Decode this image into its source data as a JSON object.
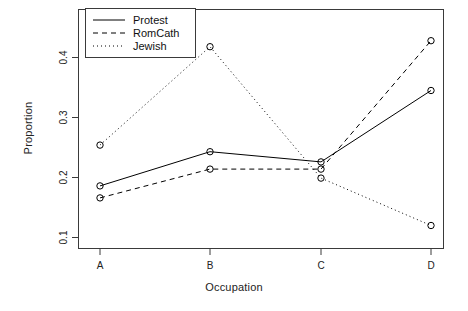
{
  "chart_data": {
    "type": "line",
    "title": "",
    "xlabel": "Occupation",
    "ylabel": "Proportion",
    "categories": [
      "A",
      "B",
      "C",
      "D"
    ],
    "xtick_labels": [
      "A",
      "B",
      "C",
      "D"
    ],
    "ytick_labels": [
      "0.1",
      "0.2",
      "0.3",
      "0.4"
    ],
    "ytick_values": [
      0.1,
      0.2,
      0.3,
      0.4
    ],
    "ylim": [
      0.085,
      0.435
    ],
    "xlim": [
      0.6,
      4.4
    ],
    "grid": false,
    "markers": "open-circle",
    "legend_position": "top-left",
    "series": [
      {
        "name": "Protest",
        "linestyle": "solid",
        "color": "#000000",
        "values": [
          0.186,
          0.243,
          0.226,
          0.345
        ]
      },
      {
        "name": "RomCath",
        "linestyle": "dashed",
        "color": "#000000",
        "values": [
          0.166,
          0.214,
          0.214,
          0.428
        ]
      },
      {
        "name": "Jewish",
        "linestyle": "dotted",
        "color": "#000000",
        "values": [
          0.254,
          0.418,
          0.199,
          0.12
        ]
      }
    ]
  },
  "legend": {
    "entries": [
      {
        "label": "Protest",
        "style": "solid"
      },
      {
        "label": "RomCath",
        "style": "dashed"
      },
      {
        "label": "Jewish",
        "style": "dotted"
      }
    ]
  },
  "axes": {
    "x_title": "Occupation",
    "y_title": "Proportion"
  }
}
